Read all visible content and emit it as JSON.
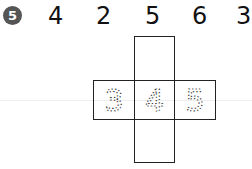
{
  "problem": {
    "number": "5",
    "sequence": [
      "4",
      "2",
      "5",
      "6",
      "3"
    ]
  },
  "net": {
    "traced_digits": [
      "3",
      "4",
      "5"
    ]
  }
}
